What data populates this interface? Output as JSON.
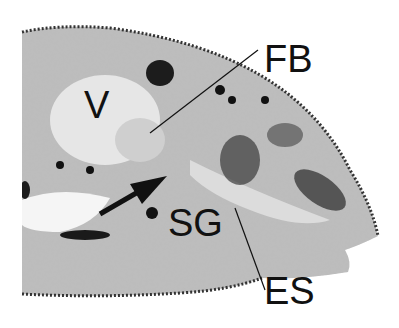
{
  "figure": {
    "labels": {
      "v": "V",
      "fb": "FB",
      "sg": "SG",
      "es": "ES"
    },
    "colors": {
      "background": "#ffffff",
      "tissue": "#c8c8c8",
      "dark": "#1a1a1a"
    }
  }
}
